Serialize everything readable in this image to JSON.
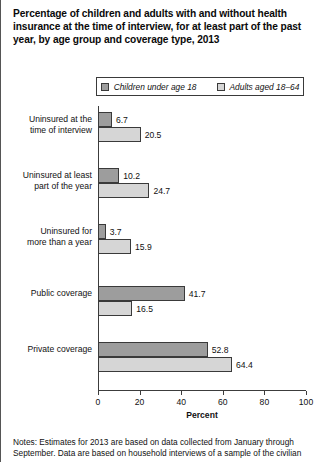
{
  "chart_data": {
    "type": "bar",
    "orientation": "horizontal",
    "title": "Percentage of children and adults with and without health insurance at the time of interview, for at least part of the past year, by age group and coverage type, 2013",
    "xlabel": "Percent",
    "ylabel": "",
    "xlim": [
      0,
      100
    ],
    "xticks": [
      "0",
      "20",
      "40",
      "60",
      "80",
      "100"
    ],
    "grid": false,
    "legend_position": "top-center",
    "categories": [
      "Uninsured at the time of interview",
      "Uninsured at least part of the year",
      "Uninsured for more than a year",
      "Public coverage",
      "Private coverage"
    ],
    "category_lines": [
      [
        "Uninsured at the",
        "time of interview"
      ],
      [
        "Uninsured at least",
        "part of the year"
      ],
      [
        "Uninsured for",
        "more than a year"
      ],
      [
        "Public coverage"
      ],
      [
        "Private coverage"
      ]
    ],
    "series": [
      {
        "name": "Children under age 18",
        "color": "#9d9d9d",
        "values": [
          6.7,
          10.2,
          3.7,
          41.7,
          52.8
        ],
        "labels": [
          "6.7",
          "10.2",
          "3.7",
          "41.7",
          "52.8"
        ]
      },
      {
        "name": "Adults aged 18–64",
        "color": "#d6d6d6",
        "values": [
          20.5,
          24.7,
          15.9,
          16.5,
          64.4
        ],
        "labels": [
          "20.5",
          "24.7",
          "15.9",
          "16.5",
          "64.4"
        ]
      }
    ]
  },
  "legend": {
    "items": [
      {
        "label": "Children under age 18",
        "color": "#9d9d9d"
      },
      {
        "label": "Adults aged 18–64",
        "color": "#d6d6d6"
      }
    ]
  },
  "notes": {
    "text": "Notes: Estimates for 2013 are based on data collected from January through September. Data are based on household interviews of a sample of the civilian"
  },
  "colors": {
    "children": "#9d9d9d",
    "adults": "#d6d6d6",
    "axis": "#3c3c3c",
    "text": "#111111"
  }
}
